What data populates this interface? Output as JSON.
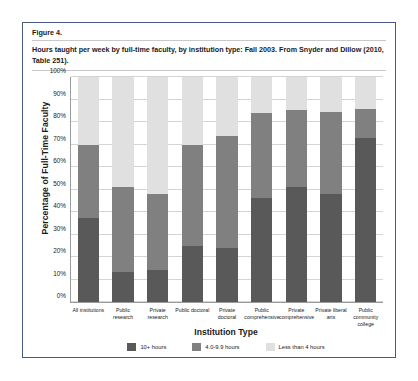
{
  "figure": {
    "label": "Figure 4.",
    "caption": "Hours taught per week by full-time faculty, by institution type: Fall 2003. From Snyder and Dillow (2010, Table 251)."
  },
  "chart_data": {
    "type": "bar",
    "subtype": "stacked-bar-100",
    "title": "Hours taught per week by full-time faculty, by institution type: Fall 2003. From Snyder and Dillow (2010, Table 251).",
    "xlabel": "Institution Type",
    "ylabel": "Percentage of Full-Time Faculty",
    "ylim": [
      0,
      100
    ],
    "ytick_labels": [
      "0%",
      "10%",
      "20%",
      "30%",
      "40%",
      "50%",
      "60%",
      "70%",
      "80%",
      "90%",
      "100%"
    ],
    "ytick_values": [
      0,
      10,
      20,
      30,
      40,
      50,
      60,
      70,
      80,
      90,
      100
    ],
    "grid": true,
    "legend_position": "bottom",
    "categories": [
      "All institutions",
      "Public research",
      "Private research",
      "Public doctoral",
      "Private doctoral",
      "Public comprehensive",
      "Private comprehensive",
      "Private liberal arts",
      "Public community college"
    ],
    "series": [
      {
        "name": "10+ hours",
        "color": "#595959",
        "values": [
          37.5,
          13.5,
          14.2,
          24.7,
          23.8,
          46.2,
          51.3,
          47.8,
          73.0
        ]
      },
      {
        "name": "4.0-9.9 hours",
        "color": "#808080",
        "values": [
          32.2,
          37.6,
          33.8,
          45.3,
          49.8,
          37.6,
          34.0,
          36.8,
          12.7
        ]
      },
      {
        "name": "Less than 4 hours",
        "color": "#e0e0e0",
        "values": [
          30.3,
          48.9,
          52.0,
          30.0,
          26.4,
          16.2,
          14.7,
          15.4,
          14.3
        ]
      }
    ]
  }
}
